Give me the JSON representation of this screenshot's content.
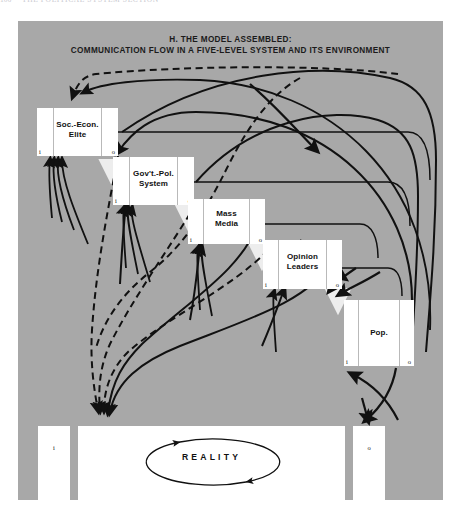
{
  "running_head": {
    "page_number": "106",
    "text": "THE POLITICAL SYSTEM SECTION"
  },
  "title": {
    "line1": "H. THE MODEL ASSEMBLED:",
    "line2": "COMMUNICATION FLOW IN A FIVE-LEVEL SYSTEM AND ITS ENVIRONMENT"
  },
  "io_labels": {
    "input": "i",
    "output": "o"
  },
  "levels": [
    {
      "id": "soc-econ-elite",
      "label_line1": "Soc.-Econ.",
      "label_line2": "Elite",
      "x": 37,
      "y": 108,
      "w": 81,
      "h": 48
    },
    {
      "id": "govt-pol-system",
      "label_line1": "Gov't.-Pol.",
      "label_line2": "System",
      "x": 113,
      "y": 157,
      "w": 81,
      "h": 48
    },
    {
      "id": "mass-media",
      "label_line1": "Mass",
      "label_line2": "Media",
      "x": 188,
      "y": 199,
      "w": 77,
      "h": 45
    },
    {
      "id": "opinion-leaders",
      "label_line1": "Opinion",
      "label_line2": "Leaders",
      "x": 263,
      "y": 240,
      "w": 79,
      "h": 49
    },
    {
      "id": "population",
      "label_line1": "Pop.",
      "label_line2": "",
      "x": 344,
      "y": 300,
      "w": 70,
      "h": 66
    }
  ],
  "reality": {
    "label": "REALITY",
    "input_label": "i",
    "output_label": "o",
    "left_segment": {
      "x": 38,
      "y": 426,
      "w": 32,
      "h": 74
    },
    "center_segment": {
      "x": 78,
      "y": 426,
      "w": 267,
      "h": 74
    },
    "right_segment": {
      "x": 353,
      "y": 426,
      "w": 32,
      "h": 74
    }
  },
  "colors": {
    "panel_background": "#a8a8a8",
    "box_fill": "#ffffff",
    "flow_line": "#111111",
    "internal_arrow": "#ededed",
    "page_background": "#ffffff"
  },
  "legend_semantics": {
    "solid_arrow": "direct communication flow",
    "dashed_arrow": "indirect / feedback communication flow",
    "white_arrow": "downward flow between adjacent levels",
    "ellipse": "internal circulation within level"
  }
}
